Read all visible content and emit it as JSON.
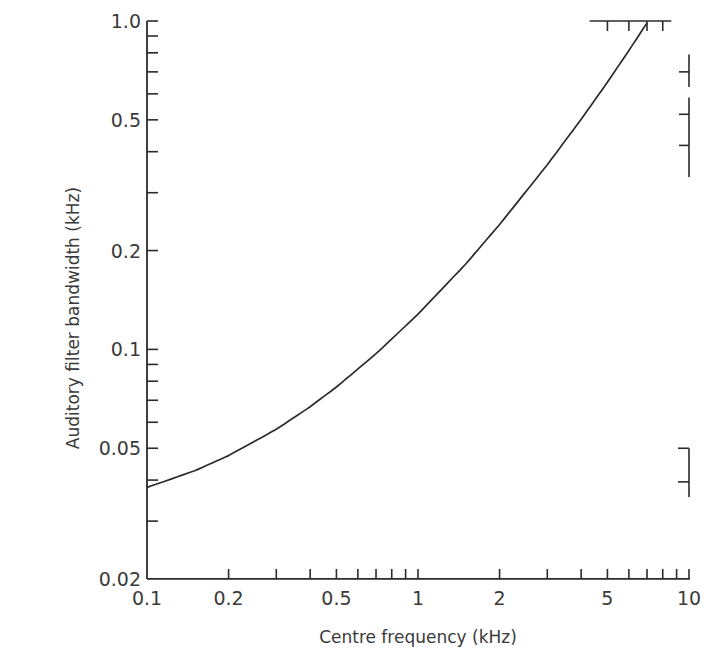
{
  "chart_data": {
    "type": "line",
    "title": "",
    "xlabel": "Centre frequency (kHz)",
    "ylabel": "Auditory filter bandwidth (kHz)",
    "xscale": "log",
    "yscale": "log",
    "xlim": [
      0.1,
      10
    ],
    "ylim": [
      0.02,
      1.0
    ],
    "grid": false,
    "legend": null,
    "x_tick_labels": [
      {
        "value": 0.1,
        "label": "0.1"
      },
      {
        "value": 0.2,
        "label": "0.2"
      },
      {
        "value": 0.5,
        "label": "0.5"
      },
      {
        "value": 1,
        "label": "1"
      },
      {
        "value": 2,
        "label": "2"
      },
      {
        "value": 5,
        "label": "5"
      },
      {
        "value": 10,
        "label": "10"
      }
    ],
    "x_minor_ticks": [
      0.2,
      0.3,
      0.4,
      0.5,
      0.6,
      0.7,
      0.8,
      0.9,
      1,
      2,
      3,
      4,
      5,
      6,
      7,
      8,
      9,
      10
    ],
    "y_tick_labels": [
      {
        "value": 1.0,
        "label": "1.0"
      },
      {
        "value": 0.5,
        "label": "0.5"
      },
      {
        "value": 0.2,
        "label": "0.2"
      },
      {
        "value": 0.1,
        "label": "0.1"
      },
      {
        "value": 0.05,
        "label": "0.05"
      },
      {
        "value": 0.02,
        "label": "0.02"
      }
    ],
    "y_minor_ticks": [
      0.03,
      0.04,
      0.05,
      0.06,
      0.07,
      0.08,
      0.09,
      0.1,
      0.2,
      0.3,
      0.4,
      0.5,
      0.6,
      0.7,
      0.8,
      0.9,
      1.0
    ],
    "series": [
      {
        "name": "Auditory filter bandwidth",
        "x": [
          0.1,
          0.15,
          0.2,
          0.3,
          0.4,
          0.5,
          0.7,
          1.0,
          1.5,
          2.0,
          3.0,
          4.0,
          5.0,
          6.0,
          7.0
        ],
        "y": [
          0.038,
          0.0427,
          0.0475,
          0.0571,
          0.0669,
          0.0768,
          0.097,
          0.128,
          0.182,
          0.24,
          0.365,
          0.502,
          0.651,
          0.813,
          0.987
        ],
        "color": "#2b2b2b"
      }
    ],
    "annotations": {
      "top_right_ruler": {
        "description": "horizontal scale fragment at y=1.0 spanning x≈4–8 kHz with tick marks at 5,6,7,8"
      },
      "right_bracket_upper": {
        "description": "vertical scale fragments at x=10 between y≈0.33 and 1.0 with ticks at ~0.7, ~0.55, ~0.42"
      },
      "right_bracket_lower": {
        "description": "vertical scale fragment at x=10 between y≈0.035 and 0.05 with tick at ~0.039"
      }
    }
  },
  "layout": {
    "px_per_decade_x": 271,
    "px_per_decade_y": 328.4,
    "origin_x_px": 147,
    "origin_y_px": 579,
    "ytop_px": 21,
    "line_color": "#2b2b2b"
  }
}
